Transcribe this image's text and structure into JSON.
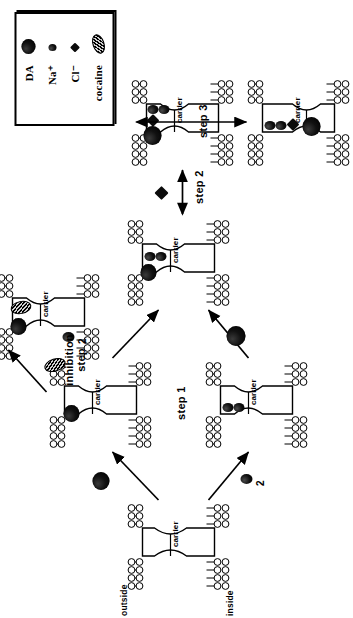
{
  "figure": {
    "title_present": false,
    "orientation": "rotated-90-ccw",
    "legend": {
      "items": [
        {
          "label": "DA",
          "symbol": "filled-large-circle"
        },
        {
          "label": "Na⁺",
          "symbol": "filled-small-circle"
        },
        {
          "label": "Cl⁻",
          "symbol": "filled-small-diamond"
        },
        {
          "label": "cocaine",
          "symbol": "hatched-lozenge"
        }
      ]
    },
    "membrane_labels": {
      "outside": "outside",
      "inside": "inside",
      "carrier": "carrier"
    },
    "steps": {
      "step1": "step 1",
      "step2": "step 2",
      "step3": "step 3",
      "inhibition_line1": "inhibition",
      "inhibition_line2": "step"
    },
    "stoichiometry": {
      "na_count_upper": "2",
      "na_count_lower": "2"
    },
    "states": [
      {
        "id": "state-empty-carrier",
        "name": "empty-carrier",
        "carrier_label": "carrier",
        "bound": []
      },
      {
        "id": "state-da-bound",
        "name": "da-bound-carrier",
        "carrier_label": "carrier",
        "bound": [
          "DA"
        ]
      },
      {
        "id": "state-na-bound",
        "name": "na-bound-carrier",
        "carrier_label": "carrier",
        "bound": [
          "Na⁺",
          "Na⁺"
        ]
      },
      {
        "id": "state-da-na-bound",
        "name": "da-na-bound-carrier",
        "carrier_label": "carrier",
        "bound": [
          "DA",
          "Na⁺",
          "Na⁺"
        ]
      },
      {
        "id": "state-cocaine-bound",
        "name": "cocaine-inhibited-carrier",
        "carrier_label": "carrier",
        "bound": [
          "DA",
          "cocaine"
        ]
      },
      {
        "id": "state-da-na-cl-bound",
        "name": "da-na-cl-bound-carrier",
        "carrier_label": "carrier",
        "bound": [
          "DA",
          "Na⁺",
          "Na⁺",
          "Cl⁻"
        ]
      },
      {
        "id": "state-translocated",
        "name": "translocated-carrier",
        "carrier_label": "carrier",
        "bound": [
          "DA",
          "Na⁺",
          "Na⁺",
          "Cl⁻"
        ]
      }
    ],
    "colors": {
      "ink": "#000000",
      "paper": "#ffffff",
      "cocaine_hatch_light": "#cfcfcf"
    }
  }
}
